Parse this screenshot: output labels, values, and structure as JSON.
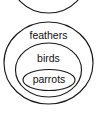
{
  "diagram": {
    "type": "euler-nested-sets",
    "background_color": "#ffffff",
    "stroke_color": "#1a1a1a",
    "text_color": "#111111",
    "sets": [
      {
        "id": "feathers",
        "label": "feathers",
        "level": 1,
        "shape": "circle",
        "cx": 48.5,
        "cy": 63,
        "rx": 44.5,
        "ry": 41,
        "label_x": 48.5,
        "label_y": 36
      },
      {
        "id": "birds",
        "label": "birds",
        "level": 2,
        "shape": "ellipse",
        "cx": 48.5,
        "cy": 70,
        "rx": 33,
        "ry": 27,
        "label_x": 48.5,
        "label_y": 59
      },
      {
        "id": "parrots",
        "label": "parrots",
        "level": 3,
        "shape": "ellipse",
        "cx": 49,
        "cy": 80,
        "rx": 26,
        "ry": 10.5,
        "label_x": 49,
        "label_y": 80
      }
    ],
    "partial_shape": {
      "id": "cutoff-circle-above",
      "label": "",
      "shape": "circle",
      "cx": 48.5,
      "cy": -27,
      "rx": 40,
      "ry": 40,
      "note": "arc clipped by top edge of image"
    }
  }
}
